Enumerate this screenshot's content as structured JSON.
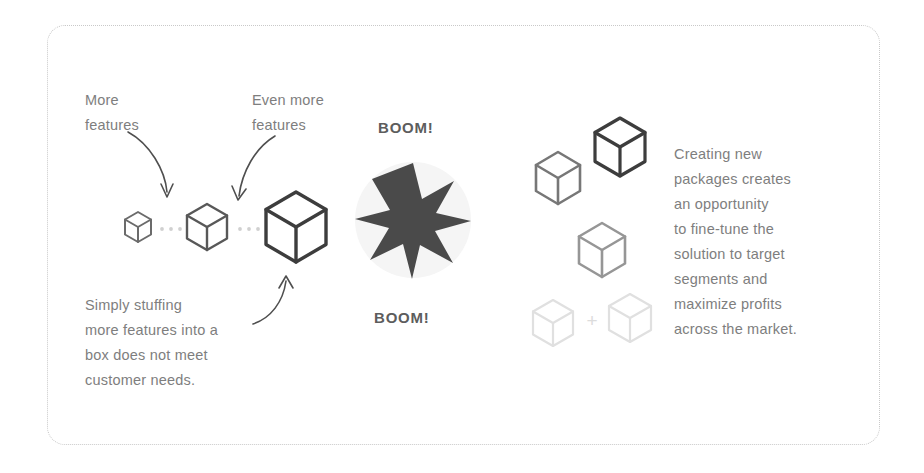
{
  "slide": {
    "background_color": "#ffffff",
    "frame": {
      "style": "dotted-rounded-rectangle",
      "color": "#c9c9c9"
    }
  },
  "labels": {
    "more_features": "More\nfeatures",
    "even_more_features": "Even more\nfeatures",
    "simply_stuffing": "Simply stuffing\nmore features into a\nbox does not meet\ncustomer needs.",
    "creating_new_packages": "Creating new\npackages creates\nan opportunity\nto fine-tune the\nsolution to target\nsegments and\nmaximize profits\nacross the market."
  },
  "burst": {
    "boom_top": "BOOM!",
    "boom_bottom": "BOOM!",
    "star_points": 8,
    "star_color": "#4a4a4a",
    "halo_color": "#f4f4f4"
  },
  "left_group": {
    "caption_color": "#7e7e7e",
    "cubes": [
      {
        "name": "small-cube",
        "size": 30,
        "stroke": "#6b6b6b",
        "stroke_width": 2
      },
      {
        "name": "medium-cube",
        "size": 46,
        "stroke": "#585858",
        "stroke_width": 2.4
      },
      {
        "name": "large-cube",
        "size": 70,
        "stroke": "#3d3d3d",
        "stroke_width": 3.4
      }
    ],
    "connectors": {
      "style": "dotted",
      "color": "#d0d0d0",
      "dots": 3
    },
    "arrows": [
      {
        "name": "arrow-to-small-cube",
        "direction": "down"
      },
      {
        "name": "arrow-to-medium-cube",
        "direction": "down"
      },
      {
        "name": "arrow-to-large-cube",
        "direction": "up"
      }
    ]
  },
  "right_group": {
    "cubes": [
      {
        "name": "package-cube-mid-left",
        "size": 52,
        "stroke": "#777777",
        "stroke_width": 2.6
      },
      {
        "name": "package-cube-top-right",
        "size": 58,
        "stroke": "#3d3d3d",
        "stroke_width": 3.2
      },
      {
        "name": "package-cube-center",
        "size": 54,
        "stroke": "#969696",
        "stroke_width": 2.6
      },
      {
        "name": "package-cube-faint-left",
        "size": 46,
        "stroke": "#e0e0e0",
        "stroke_width": 2.2
      },
      {
        "name": "package-cube-faint-right",
        "size": 48,
        "stroke": "#e0e0e0",
        "stroke_width": 2.2
      }
    ],
    "plus_sign": "+",
    "plus_color": "#dcdcdc"
  }
}
